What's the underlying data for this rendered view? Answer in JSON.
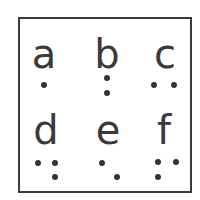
{
  "cells": [
    {
      "letter": "a",
      "dots": [
        1
      ]
    },
    {
      "letter": "b",
      "dots": [
        1,
        2
      ]
    },
    {
      "letter": "c",
      "dots": [
        1,
        4
      ]
    },
    {
      "letter": "d",
      "dots": [
        1,
        4,
        5
      ]
    },
    {
      "letter": "e",
      "dots": [
        1,
        5
      ]
    },
    {
      "letter": "f",
      "dots": [
        1,
        2,
        4
      ]
    }
  ],
  "colors": {
    "ink": "#3a3a3a",
    "dot": "#333333",
    "background": "#ffffff"
  }
}
